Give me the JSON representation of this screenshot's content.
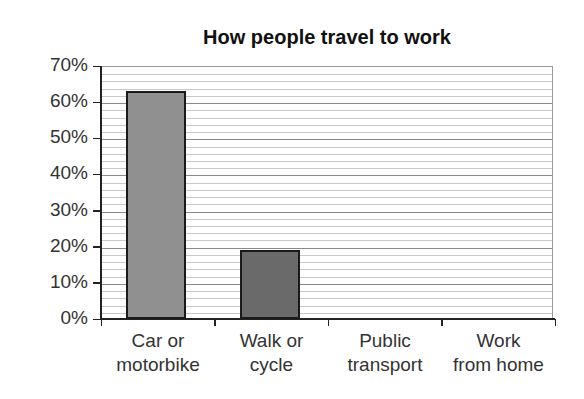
{
  "chart_data": {
    "type": "bar",
    "title": "How people travel to work",
    "xlabel": "",
    "ylabel": "",
    "categories": [
      "Car or motorbike",
      "Walk or cycle",
      "Public transport",
      "Work from home"
    ],
    "category_lines": [
      [
        "Car or",
        "motorbike"
      ],
      [
        "Walk or",
        "cycle"
      ],
      [
        "Public",
        "transport"
      ],
      [
        "Work",
        "from home"
      ]
    ],
    "values": [
      63,
      19,
      null,
      null
    ],
    "bar_colors": [
      "#909090",
      "#6a6a6a",
      null,
      null
    ],
    "ylim": [
      0,
      70
    ],
    "yticks": [
      "0%",
      "10%",
      "20%",
      "30%",
      "40%",
      "50%",
      "60%",
      "70%"
    ],
    "grid": {
      "major_step": 10,
      "minor_step": 2,
      "on": true
    },
    "legend": null
  }
}
